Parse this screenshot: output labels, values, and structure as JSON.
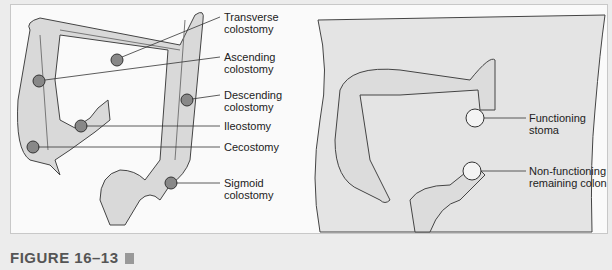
{
  "figure": {
    "caption": "FIGURE 16–13",
    "left_diagram": {
      "labels": [
        {
          "id": "transverse",
          "line1": "Transverse",
          "line2": "colostomy"
        },
        {
          "id": "ascending",
          "line1": "Ascending",
          "line2": "colostomy"
        },
        {
          "id": "descending",
          "line1": "Descending",
          "line2": "colostomy"
        },
        {
          "id": "ileostomy",
          "line1": "Ileostomy",
          "line2": ""
        },
        {
          "id": "cecostomy",
          "line1": "Cecostomy",
          "line2": ""
        },
        {
          "id": "sigmoid",
          "line1": "Sigmoid",
          "line2": "colostomy"
        }
      ]
    },
    "right_diagram": {
      "labels": [
        {
          "id": "functioning",
          "line1": "Functioning",
          "line2": "stoma"
        },
        {
          "id": "nonfunctioning",
          "line1": "Non-functioning",
          "line2": "remaining colon"
        }
      ]
    }
  }
}
